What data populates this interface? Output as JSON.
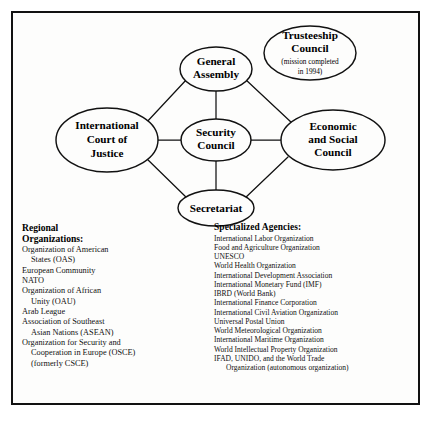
{
  "diagram": {
    "type": "organizational-network",
    "nodes": [
      {
        "id": "general-assembly",
        "lines": [
          "General",
          "Assembly"
        ],
        "sub": []
      },
      {
        "id": "trusteeship-council",
        "lines": [
          "Trusteeship",
          "Council"
        ],
        "sub": [
          "(mission completed",
          "in 1994)"
        ]
      },
      {
        "id": "international-court-of-justice",
        "lines": [
          "International",
          "Court of",
          "Justice"
        ],
        "sub": []
      },
      {
        "id": "security-council",
        "lines": [
          "Security",
          "Council"
        ],
        "sub": []
      },
      {
        "id": "economic-and-social-council",
        "lines": [
          "Economic",
          "and Social",
          "Council"
        ],
        "sub": []
      },
      {
        "id": "secretariat",
        "lines": [
          "Secretariat"
        ],
        "sub": []
      }
    ],
    "edges": [
      {
        "from": "general-assembly",
        "to": "international-court-of-justice"
      },
      {
        "from": "general-assembly",
        "to": "security-council"
      },
      {
        "from": "general-assembly",
        "to": "economic-and-social-council"
      },
      {
        "from": "international-court-of-justice",
        "to": "security-council"
      },
      {
        "from": "international-court-of-justice",
        "to": "secretariat"
      },
      {
        "from": "security-council",
        "to": "economic-and-social-council"
      },
      {
        "from": "security-council",
        "to": "secretariat"
      },
      {
        "from": "secretariat",
        "to": "economic-and-social-council"
      }
    ]
  },
  "regional": {
    "heading": "Regional\nOrganizations:",
    "items": [
      {
        "main": "Organization of American",
        "cont": "States (OAS)"
      },
      {
        "main": "European Community",
        "cont": ""
      },
      {
        "main": "NATO",
        "cont": ""
      },
      {
        "main": "Organization of African",
        "cont": "Unity (OAU)"
      },
      {
        "main": "Arab League",
        "cont": ""
      },
      {
        "main": "Association of Southeast",
        "cont": "Asian Nations (ASEAN)"
      },
      {
        "main": "Organization for Security and",
        "cont": "Cooperation in Europe (OSCE)\n(formerly CSCE)"
      }
    ]
  },
  "specialized": {
    "heading": "Specialized Agencies:",
    "items": [
      {
        "main": "International Labor Organization",
        "cont": ""
      },
      {
        "main": "Food and Agriculture Organization",
        "cont": ""
      },
      {
        "main": "UNESCO",
        "cont": ""
      },
      {
        "main": "World Health Organization",
        "cont": ""
      },
      {
        "main": "International Development Association",
        "cont": ""
      },
      {
        "main": "International Monetary Fund (IMF)",
        "cont": ""
      },
      {
        "main": "IBRD (World Bank)",
        "cont": ""
      },
      {
        "main": "International Finance Corporation",
        "cont": ""
      },
      {
        "main": "International Civil Aviation Organization",
        "cont": ""
      },
      {
        "main": "Universal Postal Union",
        "cont": ""
      },
      {
        "main": "World Meteorological Organization",
        "cont": ""
      },
      {
        "main": "International Maritime Organization",
        "cont": ""
      },
      {
        "main": "World Intellectual Property Organization",
        "cont": ""
      },
      {
        "main": "IFAD, UNIDO, and the World Trade",
        "cont": "Organization (autonomous organization)"
      }
    ]
  },
  "colors": {
    "ink": "#111111",
    "page": "#ffffff",
    "panel": "#fdfdfc"
  }
}
